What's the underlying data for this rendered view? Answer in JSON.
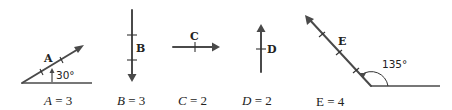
{
  "diagram": {
    "vectors": [
      {
        "name": "A",
        "magnitude_label": "A = 3",
        "var": "A",
        "value": "3",
        "angle_label": "30°",
        "direction": "30° above horizontal"
      },
      {
        "name": "B",
        "magnitude_label": "B = 3",
        "var": "B",
        "value": "3",
        "direction": "down"
      },
      {
        "name": "C",
        "magnitude_label": "C = 2",
        "var": "C",
        "value": "2",
        "direction": "right"
      },
      {
        "name": "D",
        "magnitude_label": "D = 2",
        "var": "D",
        "value": "2",
        "direction": "up"
      },
      {
        "name": "E",
        "magnitude_label": "E = 4",
        "var": "E",
        "value": "4",
        "angle_label": "135°",
        "direction": "135° from horizontal"
      }
    ],
    "colors": {
      "line": "#4a4a4a",
      "text": "#222222",
      "background": "#ffffff"
    }
  }
}
